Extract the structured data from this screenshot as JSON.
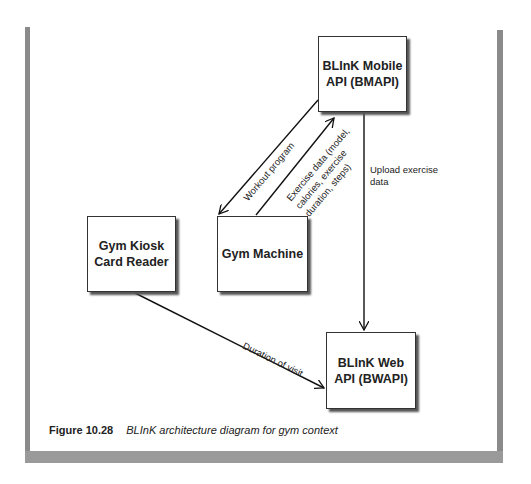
{
  "boxes": {
    "bmapi": "BLInK Mobile API (BMAPI)",
    "bmapi_line1": "BLInK Mobile",
    "bmapi_line2": "API (BMAPI)",
    "kiosk_line1": "Gym Kiosk",
    "kiosk_line2": "Card Reader",
    "machine": "Gym Machine",
    "bwapi_line1": "BLInK Web",
    "bwapi_line2": "API (BWAPI)"
  },
  "edges": {
    "workout": "Workout program",
    "exercise_line1": "Exercise data (model,",
    "exercise_line2": "calories, exercise",
    "exercise_line3": "duration, steps)",
    "upload_line1": "Upload exercise",
    "upload_line2": "data",
    "duration": "Duration of visit"
  },
  "caption": {
    "number": "Figure 10.28",
    "text": "BLInK architecture diagram for gym context"
  }
}
